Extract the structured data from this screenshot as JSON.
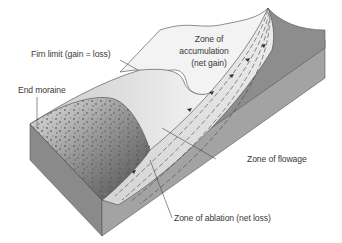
{
  "diagram": {
    "type": "glacier-cross-section",
    "labels": {
      "firn_limit": "Firn limit (gain = loss)",
      "end_moraine": "End moraine",
      "zone_accumulation_line1": "Zone of",
      "zone_accumulation_line2": "accumulation",
      "zone_accumulation_line3": "(net gain)",
      "zone_flowage": "Zone of flowage",
      "zone_ablation": "Zone of ablation (net loss)"
    },
    "colors": {
      "background": "#ffffff",
      "ice_light": "#f2f2f2",
      "ice_mid": "#d9d9d9",
      "rock_side": "#8c8c8c",
      "rock_dark": "#6e6e6e",
      "moraine_dark": "#5a5a5a",
      "text": "#3a3a3a",
      "line": "#444444"
    }
  }
}
